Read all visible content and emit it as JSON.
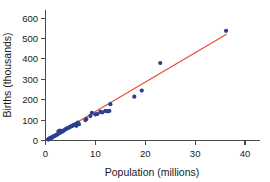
{
  "chart_data": {
    "type": "scatter",
    "title": "",
    "xlabel": "Population (millions)",
    "ylabel": "Births (thousands)",
    "xlim": [
      0,
      43
    ],
    "ylim": [
      0,
      640
    ],
    "grid": false,
    "legend": "none",
    "point_color": "#2c3f8f",
    "line_color": "#e8503a",
    "axis_color": "#4a4a4a",
    "xticks": [
      0,
      10,
      20,
      30,
      40
    ],
    "xtick_labels": [
      "0",
      "10",
      "20",
      "30",
      "40"
    ],
    "yticks": [
      0,
      100,
      200,
      300,
      400,
      500,
      600
    ],
    "ytick_labels": [
      "0",
      "100",
      "200",
      "300",
      "400",
      "500",
      "600"
    ],
    "x": [
      0.5,
      0.6,
      0.7,
      0.8,
      0.9,
      1.0,
      1.1,
      1.2,
      1.3,
      1.5,
      1.6,
      1.8,
      2.0,
      2.2,
      2.4,
      2.6,
      2.8,
      2.9,
      3.0,
      3.2,
      3.4,
      3.5,
      3.7,
      4.0,
      4.2,
      4.4,
      4.6,
      4.8,
      5.0,
      5.2,
      5.4,
      5.6,
      5.9,
      6.1,
      6.2,
      6.4,
      6.5,
      6.7,
      8.0,
      8.2,
      9.0,
      9.3,
      10.0,
      10.4,
      11.0,
      11.4,
      12.0,
      12.4,
      12.8,
      13.0,
      17.8,
      19.3,
      23.0,
      36.2
    ],
    "y": [
      5,
      6,
      8,
      9,
      10,
      12,
      13,
      14,
      15,
      18,
      20,
      22,
      25,
      28,
      30,
      45,
      36,
      48,
      40,
      42,
      45,
      47,
      50,
      55,
      58,
      60,
      62,
      65,
      68,
      70,
      72,
      75,
      78,
      80,
      72,
      85,
      88,
      80,
      100,
      105,
      120,
      135,
      128,
      130,
      140,
      138,
      145,
      143,
      145,
      178,
      215,
      245,
      380,
      538
    ],
    "fit_line": {
      "x_start": 1.0,
      "y_start": 12,
      "x_end": 36.2,
      "y_end": 520
    },
    "n_points": 54
  },
  "axes": {
    "y_title": "Births (thousands)",
    "x_title": "Population (millions)"
  }
}
